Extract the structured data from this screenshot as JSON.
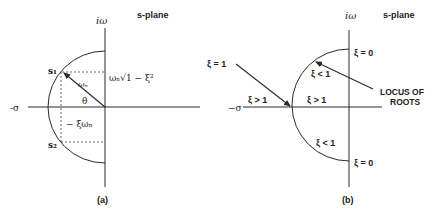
{
  "panel_a": {
    "title": "s-plane",
    "y_axis_label": "iω",
    "x_axis_label": "-σ",
    "pole_upper": "s₁",
    "pole_lower": "s₂",
    "radius_label": "ωₙ",
    "angle_label": "θ",
    "imag_part_label": "ωₙ√1 − ξ²",
    "real_part_label": "− ξωₙ",
    "caption": "(a)"
  },
  "panel_b": {
    "title": "s-plane",
    "y_axis_label": "iω",
    "x_axis_label": "−σ",
    "xi_equal_one": "ξ = 1",
    "xi_gt_one_left": "ξ > 1",
    "xi_gt_one_right": "ξ > 1",
    "xi_lt_one_upper": "ξ < 1",
    "xi_lt_one_lower": "ξ < 1",
    "xi_zero_upper": "ξ = 0",
    "xi_zero_lower": "ξ = 0",
    "locus_line1": "LOCUS OF",
    "locus_line2": "ROOTS",
    "caption": "(b)"
  }
}
